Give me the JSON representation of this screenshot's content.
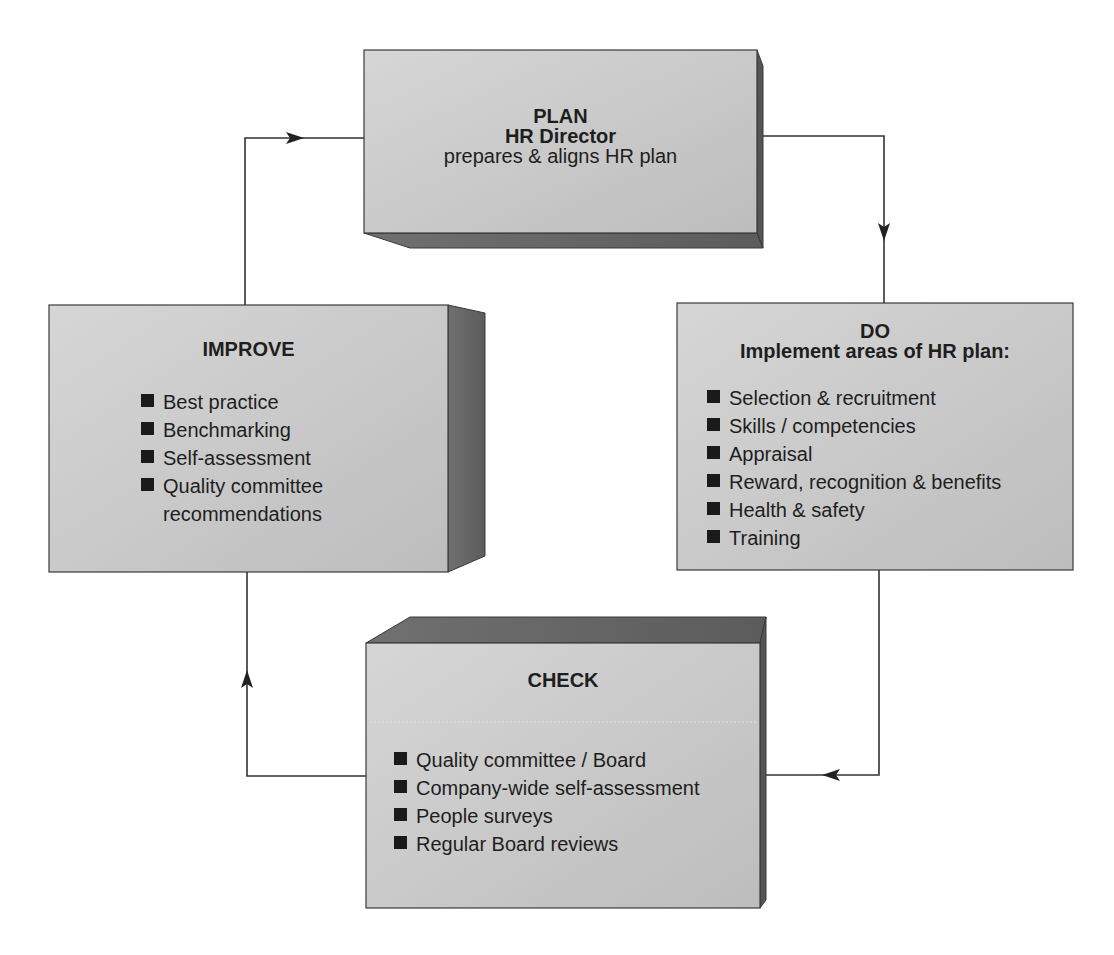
{
  "diagram": {
    "type": "PDCA-style cycle (Plan-Do-Check-Improve)",
    "colors": {
      "face": "#cfcfcf",
      "face_dark": "#bcbcbc",
      "extrusion": "#6a6a6a",
      "border": "#3a3a3a",
      "text": "#1e1e1e",
      "connector": "#333333"
    },
    "plan": {
      "title": "PLAN",
      "subtitle": "HR Director",
      "description": "prepares & aligns HR plan"
    },
    "do": {
      "title": "DO",
      "subtitle": "Implement areas of HR plan:",
      "items": [
        "Selection & recruitment",
        "Skills / competencies",
        "Appraisal",
        "Reward, recognition & benefits",
        "Health & safety",
        "Training"
      ]
    },
    "check": {
      "title": "CHECK",
      "items": [
        "Quality committee / Board",
        "Company-wide self-assessment",
        "People surveys",
        "Regular Board reviews"
      ]
    },
    "improve": {
      "title": "IMPROVE",
      "items": [
        "Best practice",
        "Benchmarking",
        "Self-assessment",
        "Quality committee",
        "recommendations"
      ]
    },
    "flow": [
      {
        "from": "PLAN",
        "to": "DO",
        "direction": "right-then-down"
      },
      {
        "from": "DO",
        "to": "CHECK",
        "direction": "down-then-left"
      },
      {
        "from": "CHECK",
        "to": "IMPROVE",
        "direction": "left-then-up"
      },
      {
        "from": "IMPROVE",
        "to": "PLAN",
        "direction": "up-then-right"
      }
    ]
  }
}
